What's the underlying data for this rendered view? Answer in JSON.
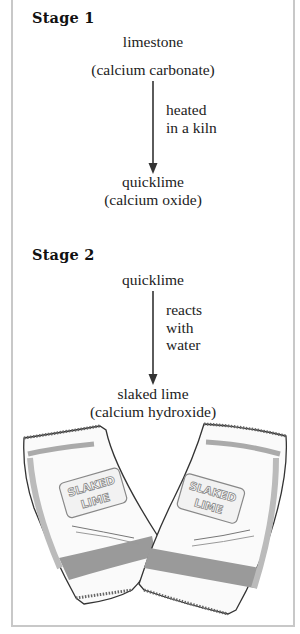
{
  "stage1": {
    "title": "Stage 1",
    "start_label": "limestone",
    "start_formula": "(calcium carbonate)",
    "process": [
      "heated",
      "in a kiln"
    ],
    "end_label": "quicklime",
    "end_formula": "(calcium oxide)"
  },
  "stage2": {
    "title": "Stage 2",
    "start_label": "quicklime",
    "process": [
      "reacts",
      "with",
      "water"
    ],
    "end_label": "slaked lime",
    "end_formula": "(calcium hydroxide)"
  },
  "illustration": {
    "description": "two bags of slaked lime",
    "bag_label_line1": "SLAKED",
    "bag_label_line2": "LIME"
  },
  "colors": {
    "border": "#c8c8c8",
    "text": "#222222",
    "arrow": "#333333",
    "bag_shade": "#9a9a9a"
  }
}
